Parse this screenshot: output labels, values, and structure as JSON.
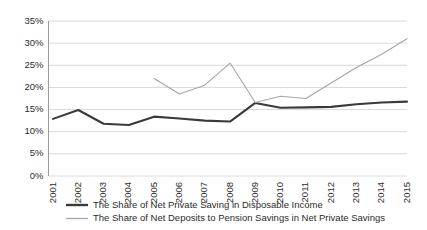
{
  "chart_data": {
    "type": "line",
    "title": "",
    "subtitle": "",
    "xlabel": "",
    "ylabel": "",
    "grid": true,
    "legend_position": "bottom",
    "categories": [
      "2001",
      "2002",
      "2003",
      "2004",
      "2005",
      "2006",
      "2007",
      "2008",
      "2009",
      "2010",
      "2011",
      "2012",
      "2013",
      "2014",
      "2015"
    ],
    "x": [
      2001,
      2002,
      2003,
      2004,
      2005,
      2006,
      2007,
      2008,
      2009,
      2010,
      2011,
      2012,
      2013,
      2014,
      2015
    ],
    "ylim": [
      0,
      35
    ],
    "ytick_labels": [
      "0%",
      "5%",
      "10%",
      "15%",
      "20%",
      "25%",
      "30%",
      "35%"
    ],
    "ytick_values": [
      0,
      5,
      10,
      15,
      20,
      25,
      30,
      35
    ],
    "xtick_labels": [
      "2001",
      "2002",
      "2003",
      "2004",
      "2005",
      "2006",
      "2007",
      "2008",
      "2009",
      "2010",
      "2011",
      "2012",
      "2013",
      "2014",
      "2015"
    ],
    "series": [
      {
        "name": "The Share of Net Private Saving in Disposable Income",
        "color": "#3a3a3a",
        "width": 2.1,
        "values": [
          12.9,
          14.9,
          11.8,
          11.5,
          13.4,
          13.0,
          12.5,
          12.3,
          16.5,
          15.4,
          15.5,
          15.6,
          16.2,
          16.6,
          16.8
        ]
      },
      {
        "name": "The Share of Net Deposits to Pension Savings in Net Private Savings",
        "color": "#a6a6a6",
        "width": 1.1,
        "values": [
          null,
          null,
          null,
          null,
          22.0,
          18.5,
          20.5,
          25.5,
          16.6,
          18.0,
          17.5,
          21.0,
          24.5,
          27.5,
          31.0
        ]
      }
    ],
    "legend": [
      {
        "label": "The Share of Net Private Saving in Disposable Income",
        "color": "#3a3a3a",
        "width": 2.4
      },
      {
        "label": "The Share of Net Deposits to Pension Savings in Net Private Savings",
        "color": "#a6a6a6",
        "width": 1.3
      }
    ]
  }
}
